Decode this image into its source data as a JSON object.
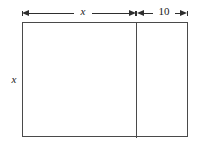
{
  "figure": {
    "background_color": "#ffffff",
    "line_color": "#4a4a4a",
    "arrow_color": "#2e2e2e",
    "text_color": "#1a1a1a"
  },
  "labels": {
    "top_left_segment": "x",
    "top_right_segment": "10",
    "left_side": "x"
  },
  "shapes": {
    "outer_rectangle": "rectangle",
    "interior_divider": "vertical-line"
  },
  "dimensions": {
    "left_arrow_label": "x",
    "right_arrow_label": "10",
    "height_label": "x"
  }
}
